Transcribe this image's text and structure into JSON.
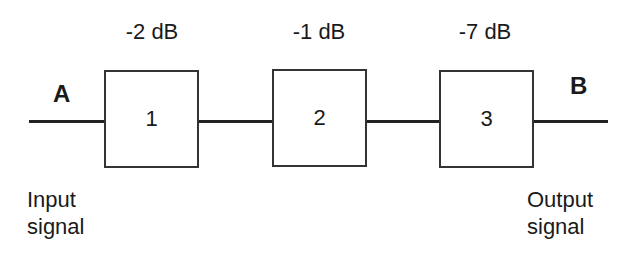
{
  "diagram": {
    "input_point": "A",
    "output_point": "B",
    "input_caption": [
      "Input",
      "signal"
    ],
    "output_caption": [
      "Output",
      "signal"
    ],
    "stages": [
      {
        "label": "1",
        "gain": "-2 dB"
      },
      {
        "label": "2",
        "gain": "-1 dB"
      },
      {
        "label": "3",
        "gain": "-7 dB"
      }
    ],
    "colors": {
      "stroke": "#333333",
      "text": "#1a1a1a",
      "background": "#ffffff"
    }
  }
}
